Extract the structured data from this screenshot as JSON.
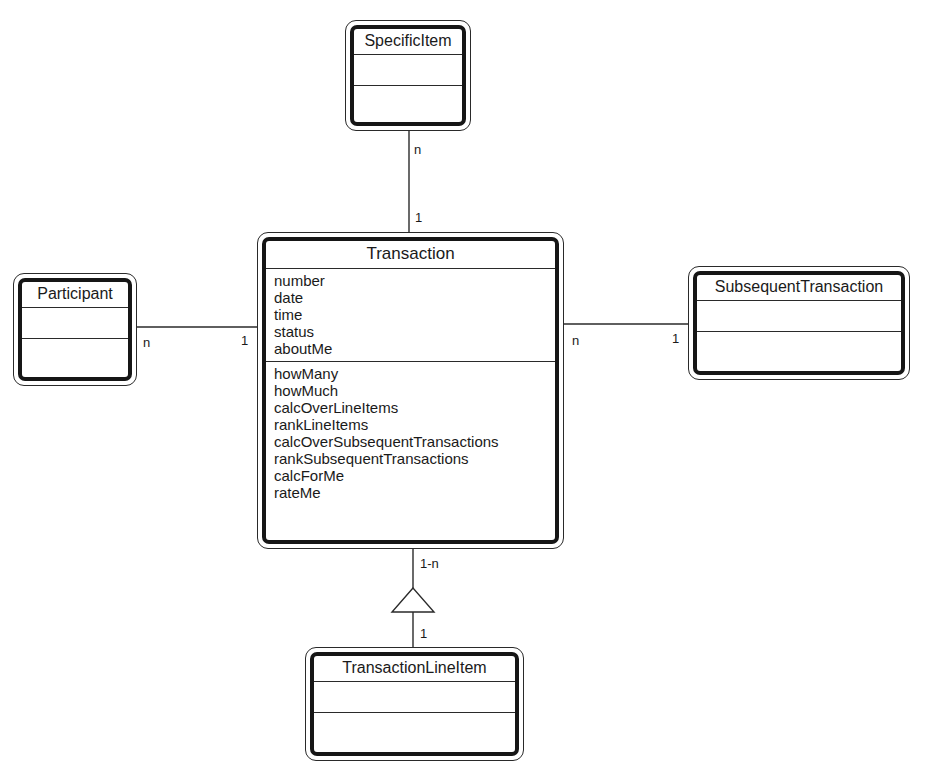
{
  "classes": {
    "specific_item": {
      "name": "SpecificItem",
      "attributes": [],
      "operations": []
    },
    "participant": {
      "name": "Participant",
      "attributes": [],
      "operations": []
    },
    "transaction": {
      "name": "Transaction",
      "attributes": [
        "number",
        "date",
        "time",
        "status",
        "aboutMe"
      ],
      "operations": [
        "howMany",
        "howMuch",
        "calcOverLineItems",
        "rankLineItems",
        "calcOverSubsequentTransactions",
        "rankSubsequentTransactions",
        "calcForMe",
        "rateMe"
      ]
    },
    "subsequent_transaction": {
      "name": "SubsequentTransaction",
      "attributes": [],
      "operations": []
    },
    "transaction_line_item": {
      "name": "TransactionLineItem",
      "attributes": [],
      "operations": []
    }
  },
  "associations": {
    "specific_item_transaction": {
      "specific_item_end": "n",
      "transaction_end": "1"
    },
    "participant_transaction": {
      "participant_end": "n",
      "transaction_end": "1"
    },
    "transaction_subsequent": {
      "transaction_end": "n",
      "subsequent_end": "1"
    },
    "transaction_line_item": {
      "transaction_end": "1-n",
      "line_item_end": "1",
      "type": "aggregation-triangle"
    }
  },
  "colors": {
    "line": "#2a2a2a",
    "border": "#161616",
    "background": "#ffffff"
  }
}
